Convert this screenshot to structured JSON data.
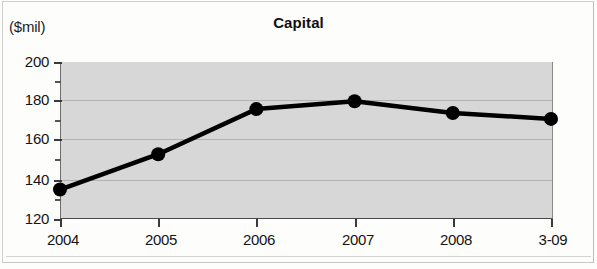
{
  "figure": {
    "unit_label": "($mil)",
    "title": "Capital"
  },
  "axes": {
    "y_ticks": [
      "200",
      "180",
      "160",
      "140",
      "120"
    ],
    "x_ticks": [
      "2004",
      "2005",
      "2006",
      "2007",
      "2008",
      "3-09"
    ]
  },
  "colors": {
    "plot_background": "#d7d7d7",
    "series_line": "#000000",
    "marker": "#000000",
    "gridline": "#b2b2b2",
    "axis": "#3a3a3a",
    "text": "#141414"
  },
  "chart_data": {
    "type": "line",
    "title": "Capital",
    "subtitle": "",
    "xlabel": "",
    "ylabel": "($mil)",
    "categories": [
      "2004",
      "2005",
      "2006",
      "2007",
      "2008",
      "3-09"
    ],
    "values": [
      135,
      153,
      176,
      180,
      174,
      171
    ],
    "series": [
      {
        "name": "Capital",
        "values": [
          135,
          153,
          176,
          180,
          174,
          171
        ]
      }
    ],
    "ylim": [
      120,
      200
    ],
    "ytick_values": [
      120,
      140,
      160,
      180,
      200
    ],
    "yminor_interval": 10,
    "grid": true,
    "legend": "none",
    "markers": "filled-circle",
    "units": "$mil"
  }
}
